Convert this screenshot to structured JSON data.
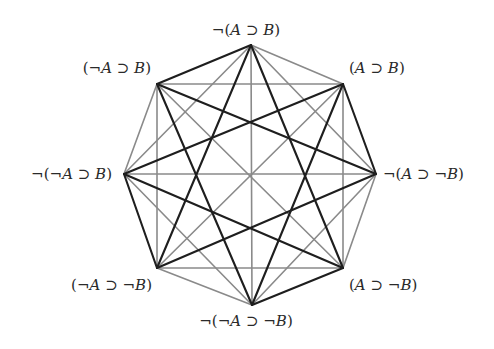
{
  "diagram": {
    "type": "octagon-of-opposition",
    "colors": {
      "dark": "#1e1e1e",
      "light": "#8a8a8a",
      "background": "#ffffff"
    },
    "vertices": [
      {
        "id": "T",
        "x": 251,
        "y": 45,
        "label": "¬(A ⊃ B)",
        "lx": 246,
        "ly": 35,
        "anchor": "middle"
      },
      {
        "id": "TR",
        "x": 343,
        "y": 84,
        "label": "(A ⊃ B)",
        "lx": 349,
        "ly": 73,
        "anchor": "start"
      },
      {
        "id": "R",
        "x": 376,
        "y": 174,
        "label": "¬(A ⊃ ¬B)",
        "lx": 383,
        "ly": 179,
        "anchor": "start"
      },
      {
        "id": "BR",
        "x": 343,
        "y": 268,
        "label": "(A ⊃ ¬B)",
        "lx": 349,
        "ly": 290,
        "anchor": "start"
      },
      {
        "id": "B",
        "x": 252,
        "y": 305,
        "label": "¬(¬A ⊃ ¬B)",
        "lx": 246,
        "ly": 326,
        "anchor": "middle"
      },
      {
        "id": "BL",
        "x": 157,
        "y": 268,
        "label": "(¬A ⊃ ¬B)",
        "lx": 152,
        "ly": 290,
        "anchor": "end"
      },
      {
        "id": "L",
        "x": 124,
        "y": 174,
        "label": "¬(¬A ⊃ B)",
        "lx": 112,
        "ly": 179,
        "anchor": "end"
      },
      {
        "id": "TL",
        "x": 157,
        "y": 84,
        "label": "(¬A ⊃ B)",
        "lx": 151,
        "ly": 73,
        "anchor": "end"
      }
    ],
    "edges": [
      {
        "from": "T",
        "to": "TL",
        "style": "dark"
      },
      {
        "from": "TR",
        "to": "R",
        "style": "dark"
      },
      {
        "from": "BR",
        "to": "B",
        "style": "dark"
      },
      {
        "from": "BL",
        "to": "L",
        "style": "dark"
      },
      {
        "from": "T",
        "to": "TR",
        "style": "light"
      },
      {
        "from": "R",
        "to": "BR",
        "style": "light"
      },
      {
        "from": "B",
        "to": "BL",
        "style": "light"
      },
      {
        "from": "L",
        "to": "TL",
        "style": "light"
      },
      {
        "from": "TL",
        "to": "TR",
        "style": "light"
      },
      {
        "from": "TR",
        "to": "BR",
        "style": "light"
      },
      {
        "from": "BR",
        "to": "BL",
        "style": "light"
      },
      {
        "from": "BL",
        "to": "TL",
        "style": "light"
      },
      {
        "from": "T",
        "to": "R",
        "style": "light"
      },
      {
        "from": "R",
        "to": "B",
        "style": "light"
      },
      {
        "from": "B",
        "to": "L",
        "style": "light"
      },
      {
        "from": "L",
        "to": "T",
        "style": "light"
      },
      {
        "from": "T",
        "to": "B",
        "style": "light"
      },
      {
        "from": "L",
        "to": "R",
        "style": "light"
      },
      {
        "from": "TL",
        "to": "BR",
        "style": "light"
      },
      {
        "from": "TR",
        "to": "BL",
        "style": "light"
      },
      {
        "from": "T",
        "to": "BR",
        "style": "dark"
      },
      {
        "from": "T",
        "to": "BL",
        "style": "dark"
      },
      {
        "from": "TR",
        "to": "B",
        "style": "dark"
      },
      {
        "from": "TR",
        "to": "L",
        "style": "dark"
      },
      {
        "from": "R",
        "to": "BL",
        "style": "dark"
      },
      {
        "from": "R",
        "to": "TL",
        "style": "dark"
      },
      {
        "from": "BR",
        "to": "L",
        "style": "dark"
      },
      {
        "from": "B",
        "to": "TL",
        "style": "dark"
      }
    ]
  }
}
